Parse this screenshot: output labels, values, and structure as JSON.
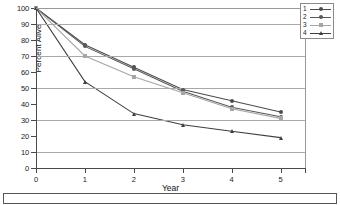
{
  "chart_data": {
    "type": "line",
    "title": "",
    "xlabel": "Year",
    "ylabel": "Percent Alive",
    "x": [
      0,
      1,
      2,
      3,
      4,
      5
    ],
    "xlim": [
      0,
      5.5
    ],
    "ylim": [
      0,
      100
    ],
    "xticks": [
      "0",
      "1",
      "2",
      "3",
      "4",
      "5"
    ],
    "yticks": [
      "0",
      "10",
      "20",
      "30",
      "40",
      "50",
      "60",
      "70",
      "80",
      "90",
      "100"
    ],
    "grid": "horizontal gridlines at 10,30,50,70,90",
    "gridlines": [
      10,
      30,
      50,
      70,
      90
    ],
    "legend_position": "top-right",
    "series": [
      {
        "name": "1",
        "marker": "circle",
        "color": "#4d4d4d",
        "values": [
          100,
          77,
          63,
          49,
          42,
          35
        ]
      },
      {
        "name": "2",
        "marker": "circle",
        "color": "#595959",
        "values": [
          100,
          76,
          62,
          48,
          38,
          32
        ]
      },
      {
        "name": "3",
        "marker": "square",
        "color": "#a6a6a6",
        "values": [
          100,
          70,
          57,
          47,
          37,
          31
        ]
      },
      {
        "name": "4",
        "marker": "triangle",
        "color": "#3f3f3f",
        "values": [
          100,
          54,
          34,
          27,
          23,
          19
        ]
      }
    ]
  },
  "chart": {
    "ylabel": "Percent Alive",
    "xlabel": "Year"
  },
  "legend": {
    "items": [
      {
        "key": "1",
        "marker": "circle",
        "color": "#4d4d4d"
      },
      {
        "key": "2",
        "marker": "circle",
        "color": "#595959"
      },
      {
        "key": "3",
        "marker": "square",
        "color": "#a6a6a6"
      },
      {
        "key": "4",
        "marker": "triangle",
        "color": "#3f3f3f"
      }
    ]
  },
  "caption": {
    "text": ""
  }
}
